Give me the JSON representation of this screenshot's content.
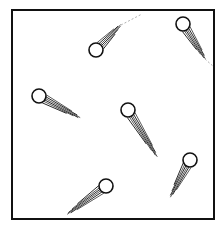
{
  "diagram": {
    "background": "#ffffff",
    "stroke_color": "#111111",
    "dash_color": "#9a9a9a",
    "container": {
      "x": 12,
      "y": 10,
      "width": 202,
      "height": 209,
      "stroke_width": 2
    },
    "particles": [
      {
        "id": "p1",
        "cx": 96,
        "cy": 50,
        "r": 7,
        "tail": [
          121,
          25
        ],
        "dash_to": [
          142,
          14
        ]
      },
      {
        "id": "p2",
        "cx": 183,
        "cy": 24,
        "r": 7,
        "tail": [
          205,
          59
        ],
        "dash_to": [
          214,
          67
        ]
      },
      {
        "id": "p3",
        "cx": 39,
        "cy": 96,
        "r": 7,
        "tail": [
          80,
          118
        ],
        "dash_to": null
      },
      {
        "id": "p4",
        "cx": 128,
        "cy": 110,
        "r": 7,
        "tail": [
          157,
          157
        ],
        "dash_to": null
      },
      {
        "id": "p5",
        "cx": 190,
        "cy": 160,
        "r": 7,
        "tail": [
          170,
          197
        ],
        "dash_to": null
      },
      {
        "id": "p6",
        "cx": 106,
        "cy": 186,
        "r": 7,
        "tail": [
          67,
          214
        ],
        "dash_to": null
      }
    ]
  }
}
